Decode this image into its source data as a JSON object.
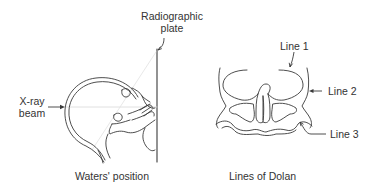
{
  "left_panel": {
    "caption": "Waters' position",
    "labels": {
      "plate_line1": "Radiographic",
      "plate_line2": "plate",
      "beam_line1": "X-ray",
      "beam_line2": "beam"
    }
  },
  "right_panel": {
    "caption": "Lines of Dolan",
    "labels": {
      "line1": "Line 1",
      "line2": "Line 2",
      "line3": "Line 3"
    }
  },
  "colors": {
    "stroke": "#3a3a3a",
    "faint": "#d8d8d8",
    "text": "#333333"
  }
}
